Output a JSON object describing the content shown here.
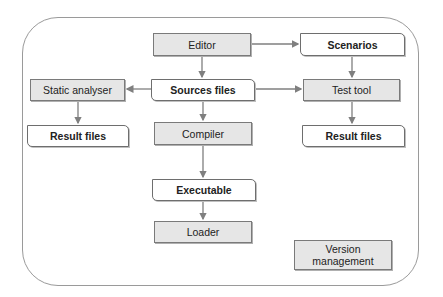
{
  "diagram": {
    "nodes": {
      "editor": {
        "label": "Editor",
        "kind": "process"
      },
      "scenarios": {
        "label": "Scenarios",
        "kind": "file"
      },
      "static_analyser": {
        "label": "Static analyser",
        "kind": "process"
      },
      "sources_files": {
        "label": "Sources files",
        "kind": "file"
      },
      "test_tool": {
        "label": "Test tool",
        "kind": "process"
      },
      "result_files_left": {
        "label": "Result files",
        "kind": "file"
      },
      "compiler": {
        "label": "Compiler",
        "kind": "process"
      },
      "result_files_right": {
        "label": "Result files",
        "kind": "file"
      },
      "executable": {
        "label": "Executable",
        "kind": "file"
      },
      "loader": {
        "label": "Loader",
        "kind": "process"
      },
      "version_management": {
        "label": "Version management",
        "kind": "process"
      }
    },
    "edges": [
      {
        "from": "Editor",
        "to": "Scenarios"
      },
      {
        "from": "Editor",
        "to": "Sources files"
      },
      {
        "from": "Sources files",
        "to": "Static analyser"
      },
      {
        "from": "Sources files",
        "to": "Test tool"
      },
      {
        "from": "Sources files",
        "to": "Compiler"
      },
      {
        "from": "Scenarios",
        "to": "Test tool"
      },
      {
        "from": "Static analyser",
        "to": "Result files (left)"
      },
      {
        "from": "Test tool",
        "to": "Result files (right)"
      },
      {
        "from": "Compiler",
        "to": "Executable"
      },
      {
        "from": "Executable",
        "to": "Loader"
      }
    ],
    "colors": {
      "process_fill": "#e6e6e6",
      "file_fill": "#ffffff",
      "border": "#7a7a7a",
      "arrow": "#7f7f7f"
    }
  }
}
